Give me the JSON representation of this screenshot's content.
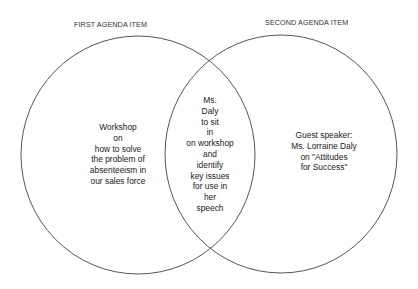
{
  "diagram": {
    "type": "venn",
    "stroke_color": "#555555",
    "sets": [
      {
        "title": "FIRST AGENDA ITEM",
        "lines": [
          "Workshop",
          "on",
          "how to solve",
          "the problem of",
          "absenteeism in",
          "our sales force"
        ]
      },
      {
        "title": "SECOND AGENDA ITEM",
        "lines": [
          "Guest speaker:",
          "Ms. Lorraine Daly",
          "on \"Attitudes",
          "for Success\""
        ]
      }
    ],
    "intersection": {
      "lines": [
        "Ms.",
        "Daly",
        "to sit",
        "in",
        "on workshop",
        "and",
        "identify",
        "key issues",
        "for use in",
        "her",
        "speech"
      ]
    }
  }
}
